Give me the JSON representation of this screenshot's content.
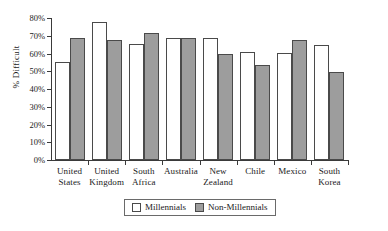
{
  "chart_data": {
    "type": "bar",
    "title": "",
    "xlabel": "",
    "ylabel": "% Difficult",
    "ylim": [
      0,
      80
    ],
    "ytick_step": 10,
    "grid": false,
    "legend_position": "bottom-center",
    "categories": [
      "United States",
      "United Kingdom",
      "South Africa",
      "Australia",
      "New Zealand",
      "Chile",
      "Mexico",
      "South Korea"
    ],
    "category_lines": [
      [
        "United",
        "States"
      ],
      [
        "United",
        "Kingdom"
      ],
      [
        "South",
        "Africa"
      ],
      [
        "Australia",
        ""
      ],
      [
        "New",
        "Zealand"
      ],
      [
        "Chile",
        ""
      ],
      [
        "Mexico",
        ""
      ],
      [
        "South",
        "Korea"
      ]
    ],
    "ytick_labels": [
      "0%",
      "10%",
      "20%",
      "30%",
      "40%",
      "50%",
      "60%",
      "70%",
      "80%"
    ],
    "ytick_values": [
      0,
      10,
      20,
      30,
      40,
      50,
      60,
      70,
      80
    ],
    "series": [
      {
        "name": "Millennials",
        "color": "#ffffff",
        "values": [
          55.0,
          77.5,
          65.5,
          68.5,
          68.5,
          61.0,
          60.5,
          65.0
        ]
      },
      {
        "name": "Non-Millennials",
        "color": "#9d9d9d",
        "values": [
          68.5,
          67.5,
          71.5,
          69.0,
          59.5,
          53.5,
          67.5,
          49.5
        ]
      }
    ]
  },
  "legend": {
    "entries": [
      {
        "label": "Millennials"
      },
      {
        "label": "Non-Millennials"
      }
    ]
  }
}
